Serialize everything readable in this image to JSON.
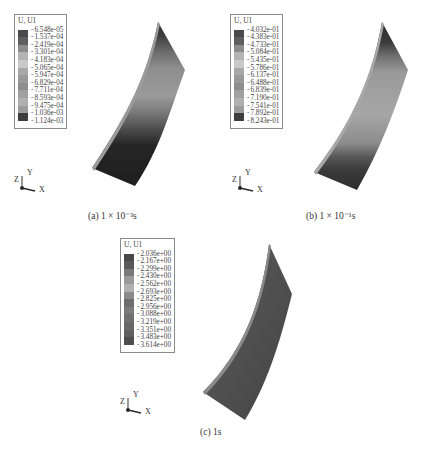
{
  "panels": [
    {
      "id": "a",
      "legend_title": "U, U1",
      "legend_values": [
        "-6.548e-05",
        "-1.537e-04",
        "-2.419e-04",
        "-3.301e-04",
        "-4.183e-04",
        "-5.065e-04",
        "-5.947e-04",
        "-6.829e-04",
        "-7.711e-04",
        "-8.593e-04",
        "-9.475e-04",
        "-1.036e-03",
        "-1.124e-03"
      ],
      "legend_colors": [
        "#4a4a4a",
        "#5e5e5e",
        "#8c8c8c",
        "#b4b4b4",
        "#c8c8c8",
        "#a8a8a8",
        "#9a9a9a",
        "#8e8e8e",
        "#a0a0a0",
        "#b0b0b0",
        "#9c9c9c",
        "#3e3e3e",
        "#2e2e2e"
      ],
      "caption": "(a) 1 × 10⁻³s",
      "axes": {
        "x": "X",
        "y": "Y",
        "z": "Z"
      }
    },
    {
      "id": "b",
      "legend_title": "U, U1",
      "legend_values": [
        "-4.032e-01",
        "-4.383e-01",
        "-4.733e-01",
        "-5.084e-01",
        "-5.435e-01",
        "-5.786e-01",
        "-6.137e-01",
        "-6.488e-01",
        "-6.839e-01",
        "-7.190e-01",
        "-7.541e-01",
        "-7.892e-01",
        "-8.243e-01"
      ],
      "legend_colors": [
        "#4a4a4a",
        "#5e5e5e",
        "#8c8c8c",
        "#b4b4b4",
        "#c8c8c8",
        "#a8a8a8",
        "#9a9a9a",
        "#8e8e8e",
        "#a0a0a0",
        "#b0b0b0",
        "#9c9c9c",
        "#3e3e3e",
        "#2e2e2e"
      ],
      "caption": "(b) 1 × 10⁻¹s",
      "axes": {
        "x": "X",
        "y": "Y",
        "z": "Z"
      }
    },
    {
      "id": "c",
      "legend_title": "U, U1",
      "legend_values": [
        "-2.036e+00",
        "-2.167e+00",
        "-2.299e+00",
        "-2.430e+00",
        "-2.562e+00",
        "-2.693e+00",
        "-2.825e+00",
        "-2.956e+00",
        "-3.088e+00",
        "-3.219e+00",
        "-3.351e+00",
        "-3.483e+00",
        "-3.614e+00"
      ],
      "legend_colors": [
        "#484848",
        "#5a5a5a",
        "#7a7a7a",
        "#9a9a9a",
        "#b0b0b0",
        "#8a8a8a",
        "#6e6e6e",
        "#7c7c7c",
        "#707070",
        "#686868",
        "#606060",
        "#4e4e4e",
        "#444444"
      ],
      "caption": "(c) 1s",
      "axes": {
        "x": "X",
        "y": "Y",
        "z": "Z"
      }
    }
  ]
}
